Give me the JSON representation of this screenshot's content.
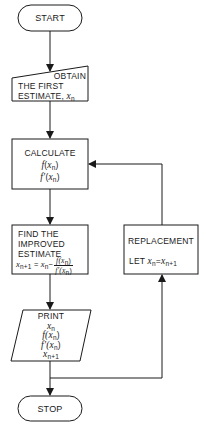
{
  "diagram": {
    "type": "flowchart",
    "stroke_color": "#1a1a1a",
    "background": "#ffffff"
  },
  "nodes": {
    "start": {
      "shape": "terminal",
      "label": "START"
    },
    "obtain": {
      "shape": "manual-input",
      "lines": [
        "OBTAIN",
        "THE FIRST",
        "ESTIMATE,"
      ],
      "var": "x",
      "var_sub": "n"
    },
    "calculate": {
      "shape": "process",
      "title": "CALCULATE",
      "f_prefix": "f",
      "fprime_prefix": "f′",
      "paren_open": "(",
      "paren_close": ")",
      "var": "x",
      "var_sub": "n"
    },
    "find": {
      "shape": "process",
      "lines": [
        "FIND THE",
        "IMPROVED",
        "ESTIMATE"
      ],
      "formula": {
        "lhs_var": "x",
        "lhs_sub": "n+1",
        "equals": " = ",
        "rhs_var": "x",
        "rhs_sub": "n",
        "minus": "−",
        "num": "f(x",
        "num_sub": "n",
        "num_close": ")",
        "den": "f′(x",
        "den_sub": "n",
        "den_close": ")"
      }
    },
    "print": {
      "shape": "data-io",
      "title": "PRINT",
      "items": [
        {
          "pre": "",
          "var": "x",
          "sub": "n",
          "post": ""
        },
        {
          "pre": "f(",
          "var": "x",
          "sub": "n",
          "post": ")"
        },
        {
          "pre": "f′(",
          "var": "x",
          "sub": "n",
          "post": ")"
        },
        {
          "pre": "",
          "var": "x",
          "sub": "n+1",
          "post": ""
        }
      ]
    },
    "replacement": {
      "shape": "process",
      "title": "REPLACEMENT",
      "let": "LET",
      "lhs_var": "x",
      "lhs_sub": "n",
      "equals": "=",
      "rhs_var": "x",
      "rhs_sub": "n+1"
    },
    "stop": {
      "shape": "terminal",
      "label": "STOP"
    }
  },
  "edges": [
    {
      "from": "start",
      "to": "obtain"
    },
    {
      "from": "obtain",
      "to": "calculate"
    },
    {
      "from": "calculate",
      "to": "find"
    },
    {
      "from": "find",
      "to": "print"
    },
    {
      "from": "print",
      "to": "stop"
    },
    {
      "from": "print",
      "to": "replacement",
      "note": "loop back path"
    },
    {
      "from": "replacement",
      "to": "calculate"
    }
  ]
}
